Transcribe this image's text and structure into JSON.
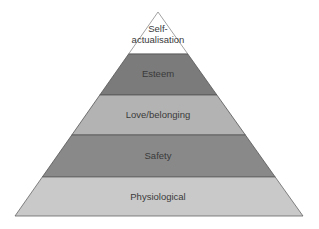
{
  "diagram": {
    "type": "pyramid",
    "levels": [
      {
        "label_line1": "Self-",
        "label_line2": "actualisation",
        "color": "#ffffff"
      },
      {
        "label": "Esteem",
        "color": "#7b7b7b"
      },
      {
        "label": "Love/belonging",
        "color": "#b3b3b3"
      },
      {
        "label": "Safety",
        "color": "#898989"
      },
      {
        "label": "Physiological",
        "color": "#c9c9c9"
      }
    ]
  }
}
